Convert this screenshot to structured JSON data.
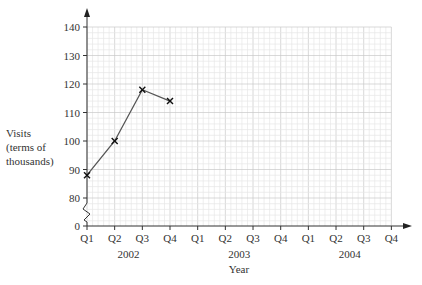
{
  "chart_data": {
    "type": "line",
    "title": "",
    "xlabel": "Year",
    "ylabel": "Visits (terms of thousands)",
    "ylabel_lines": [
      "Visits",
      "(terms of",
      "thousands)"
    ],
    "y_ticks": [
      0,
      80,
      90,
      100,
      110,
      120,
      130,
      140
    ],
    "y_axis_break": "between 0 and 80",
    "ylim": [
      80,
      140
    ],
    "grid": true,
    "x_tick_labels": [
      "Q1",
      "Q2",
      "Q3",
      "Q4",
      "Q1",
      "Q2",
      "Q3",
      "Q4",
      "Q1",
      "Q2",
      "Q3",
      "Q4"
    ],
    "year_labels": [
      {
        "label": "2002",
        "center_index": 1.5
      },
      {
        "label": "2003",
        "center_index": 5.5
      },
      {
        "label": "2004",
        "center_index": 9.5
      }
    ],
    "categories": [
      "Q1 2002",
      "Q2 2002",
      "Q3 2002",
      "Q4 2002"
    ],
    "series": [
      {
        "name": "Visits",
        "marker": "x",
        "color": "#555555",
        "values": [
          88,
          100,
          118,
          114
        ]
      }
    ],
    "legend": null
  }
}
